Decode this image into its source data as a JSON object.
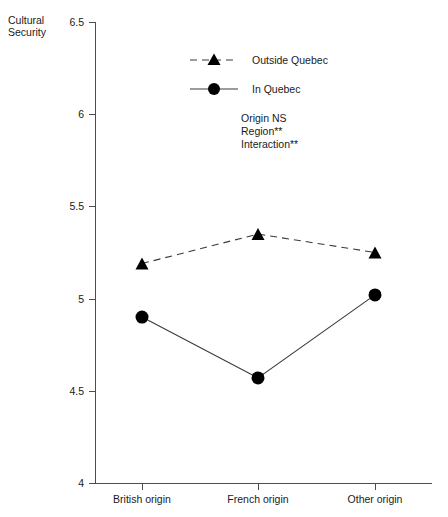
{
  "chart_data": {
    "type": "line",
    "title": "",
    "xlabel": "",
    "ylabel": "Cultural\nSecurity",
    "categories": [
      "British origin",
      "French origin",
      "Other origin"
    ],
    "ylim": [
      4,
      6.5
    ],
    "yticks": [
      "4",
      "4.5",
      "5",
      "5.5",
      "6",
      "6.5"
    ],
    "ytick_values": [
      4,
      4.5,
      5,
      5.5,
      6,
      6.5
    ],
    "grid": false,
    "legend_position": "upper-center",
    "series": [
      {
        "name": "Outside Quebec",
        "marker": "triangle",
        "linestyle": "dashed",
        "values": [
          5.19,
          5.35,
          5.25
        ]
      },
      {
        "name": "In Quebec",
        "marker": "circle",
        "linestyle": "solid",
        "values": [
          4.9,
          4.57,
          5.02
        ]
      }
    ],
    "annotations": [
      "Origin NS",
      "Region**",
      "Interaction**"
    ]
  },
  "axis": {
    "y_title_line1": "Cultural",
    "y_title_line2": "Security"
  },
  "legend": {
    "entries": [
      {
        "label": "Outside Quebec"
      },
      {
        "label": "In Quebec"
      }
    ]
  },
  "notes": {
    "line1": "Origin NS",
    "line2": "Region**",
    "line3": "Interaction**"
  },
  "ticks": {
    "y": [
      "6.5",
      "6",
      "5.5",
      "5",
      "4.5",
      "4"
    ],
    "x": [
      "British origin",
      "French origin",
      "Other origin"
    ]
  }
}
